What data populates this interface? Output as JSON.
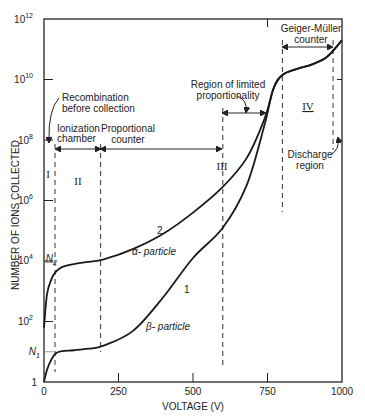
{
  "chart_data": {
    "type": "line",
    "title": "",
    "xlabel": "VOLTAGE (V)",
    "ylabel": "NUMBER OF IONS COLLECTED",
    "xlim": [
      0,
      1000
    ],
    "ylim_log10": [
      0,
      12
    ],
    "yscale": "log",
    "grid": false,
    "x_ticks": [
      "0",
      "250",
      "500",
      "750",
      "1000"
    ],
    "y_ticks": [
      {
        "base": "1",
        "exp": ""
      },
      {
        "base": "10",
        "exp": "2"
      },
      {
        "base": "10",
        "exp": "4"
      },
      {
        "base": "10",
        "exp": "6"
      },
      {
        "base": "10",
        "exp": "8"
      },
      {
        "base": "10",
        "exp": "10"
      },
      {
        "base": "10",
        "exp": "12"
      }
    ],
    "y_special_labels": {
      "N1": "N",
      "N1_sub": "1",
      "N2": "N",
      "N2_sub": "2"
    },
    "series": [
      {
        "name": "2 α-particle",
        "curve_label": "2",
        "particle_label": "α- particle",
        "x": [
          0,
          10,
          25,
          40,
          60,
          100,
          150,
          200,
          300,
          400,
          500,
          600,
          680,
          740,
          770,
          800,
          850,
          900,
          950,
          1000
        ],
        "log10_y": [
          1.8,
          2.9,
          3.4,
          3.65,
          3.8,
          3.9,
          3.97,
          4.05,
          4.4,
          4.9,
          5.6,
          6.45,
          7.4,
          8.7,
          9.7,
          10.15,
          10.35,
          10.5,
          10.75,
          11.3
        ]
      },
      {
        "name": "1 β-particle",
        "curve_label": "1",
        "particle_label": "β- particle",
        "x": [
          0,
          10,
          25,
          40,
          60,
          100,
          150,
          200,
          300,
          400,
          500,
          600,
          680,
          740,
          770,
          800,
          850,
          900,
          950,
          1000
        ],
        "log10_y": [
          0,
          0.4,
          0.75,
          0.95,
          1.02,
          1.05,
          1.1,
          1.2,
          1.7,
          2.8,
          4.1,
          5.1,
          6.5,
          8.5,
          9.7,
          10.15,
          10.35,
          10.5,
          10.75,
          11.3
        ]
      }
    ],
    "regions": [
      {
        "id": "I",
        "label": "I",
        "x_range": [
          0,
          37
        ]
      },
      {
        "id": "II",
        "label": "II",
        "x_range": [
          37,
          190
        ]
      },
      {
        "id": "III",
        "label": "III",
        "x_range": [
          190,
          600
        ]
      },
      {
        "id": "IV",
        "label": "IV",
        "x_range": [
          800,
          970
        ]
      }
    ],
    "annotations": {
      "recombination": [
        "Recombination",
        "before collection"
      ],
      "ionization": [
        "Ionization",
        "chamber"
      ],
      "proportional": [
        "Proportional",
        "counter"
      ],
      "limited": [
        "Region of limited",
        "proportionality"
      ],
      "geiger": [
        "Geiger-Müller",
        "counter"
      ],
      "discharge": [
        "Discharge",
        "region"
      ]
    },
    "colors": {
      "line": "#1a1a1a",
      "axis": "#222222",
      "dash": "#333333"
    }
  }
}
